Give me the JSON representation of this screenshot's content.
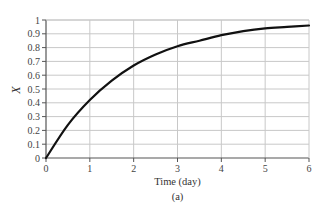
{
  "chart_data": {
    "type": "line",
    "title": "",
    "caption": "(a)",
    "xlabel": "Time (day)",
    "ylabel": "X",
    "xlim": [
      0,
      6
    ],
    "ylim": [
      0,
      1
    ],
    "grid": true,
    "legend": null,
    "x_ticks": [
      "0",
      "1",
      "2",
      "3",
      "4",
      "5",
      "6"
    ],
    "y_ticks": [
      "0",
      "0.1",
      "0.2",
      "0.3",
      "0.4",
      "0.5",
      "0.6",
      "0.7",
      "0.8",
      "0.9",
      "1"
    ],
    "series": [
      {
        "name": "X",
        "color": "#111111",
        "x": [
          0,
          0.5,
          1,
          1.5,
          2,
          2.5,
          3,
          3.5,
          4,
          4.5,
          5,
          5.5,
          6
        ],
        "y": [
          0,
          0.24,
          0.42,
          0.56,
          0.67,
          0.75,
          0.81,
          0.85,
          0.89,
          0.92,
          0.94,
          0.95,
          0.96
        ]
      }
    ]
  },
  "colors": {
    "curve": "#111111",
    "axis": "#555555",
    "grid": "#c8c8c8"
  }
}
